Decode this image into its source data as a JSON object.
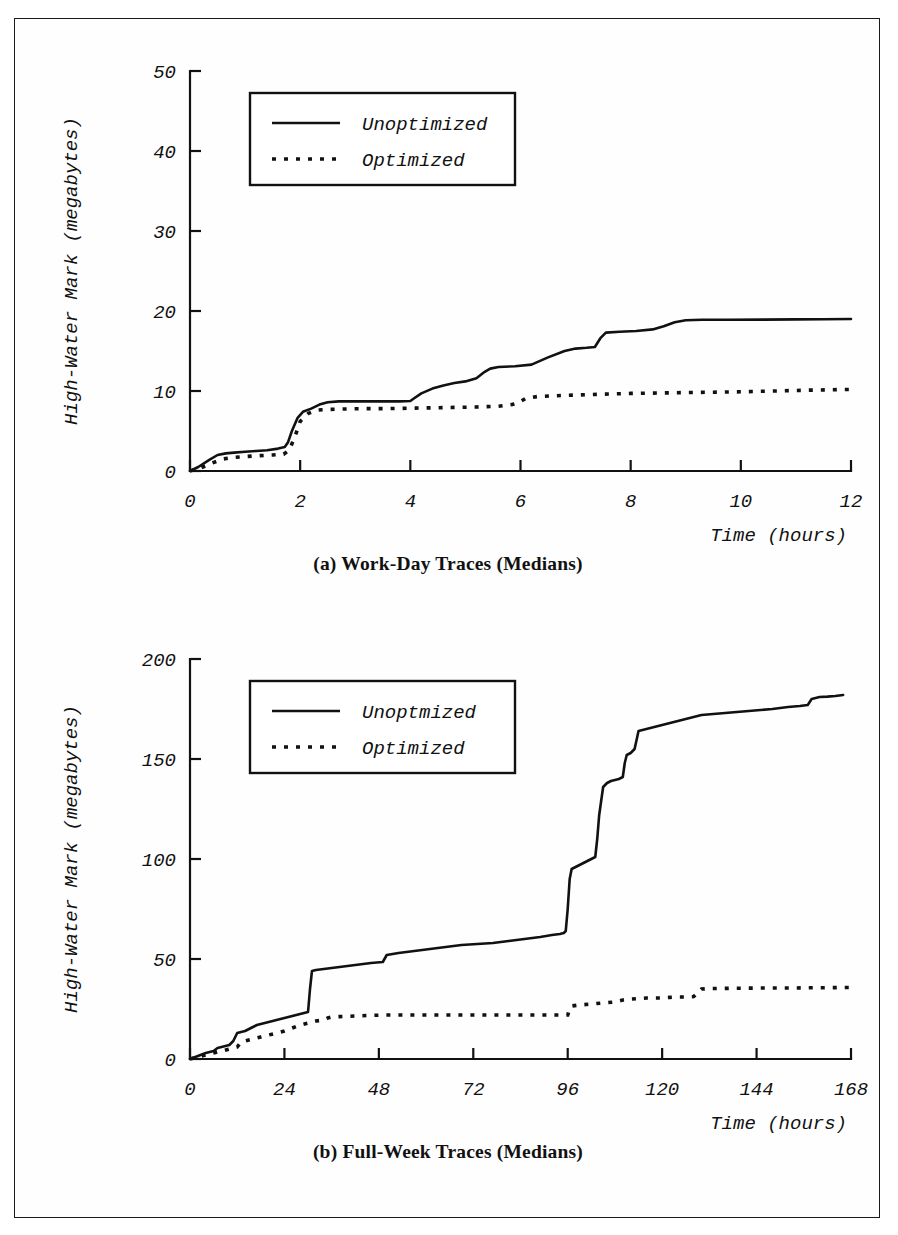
{
  "page": {
    "background_color": "#ffffff",
    "ink_color": "#111111",
    "border_color": "#1a1a1a"
  },
  "figures": [
    {
      "id": "figure-a",
      "caption": "(a) Work-Day Traces (Medians)",
      "legend": {
        "entries": [
          {
            "label": "Unoptimized",
            "style": "solid"
          },
          {
            "label": "Optimized",
            "style": "dotted"
          }
        ]
      },
      "chart_data": {
        "type": "line",
        "title": "(a) Work-Day Traces (Medians)",
        "xlabel": "Time (hours)",
        "ylabel": "High-Water Mark (megabytes)",
        "xlim": [
          0,
          12
        ],
        "ylim": [
          0,
          50
        ],
        "xticks": [
          0,
          2,
          4,
          6,
          8,
          10,
          12
        ],
        "xticklabels": [
          "0",
          "2",
          "4",
          "6",
          "8",
          "10",
          "12"
        ],
        "yticks": [
          0,
          10,
          20,
          30,
          40,
          50
        ],
        "yticklabels": [
          "0",
          "10",
          "20",
          "30",
          "40",
          "50"
        ],
        "grid": false,
        "legend_position": "upper-left",
        "series": [
          {
            "name": "Unoptimized",
            "style": "solid",
            "x": [
              0.0,
              0.15,
              0.35,
              0.5,
              0.65,
              0.8,
              1.0,
              1.2,
              1.4,
              1.6,
              1.72,
              1.78,
              1.85,
              1.95,
              2.05,
              2.2,
              2.35,
              2.5,
              2.7,
              3.0,
              3.4,
              3.8,
              4.0,
              4.05,
              4.2,
              4.4,
              4.6,
              4.8,
              5.0,
              5.2,
              5.35,
              5.45,
              5.6,
              5.9,
              6.2,
              6.5,
              6.8,
              7.0,
              7.2,
              7.35,
              7.45,
              7.55,
              7.8,
              8.1,
              8.4,
              8.6,
              8.8,
              9.0,
              9.3,
              9.8,
              10.4,
              11.0,
              11.5,
              12.0
            ],
            "y": [
              0.0,
              0.5,
              1.4,
              2.0,
              2.2,
              2.3,
              2.4,
              2.5,
              2.6,
              2.8,
              3.0,
              3.6,
              5.0,
              6.6,
              7.4,
              7.8,
              8.3,
              8.6,
              8.7,
              8.7,
              8.7,
              8.7,
              8.75,
              9.0,
              9.7,
              10.3,
              10.7,
              11.0,
              11.2,
              11.6,
              12.4,
              12.8,
              13.0,
              13.1,
              13.3,
              14.2,
              15.0,
              15.3,
              15.4,
              15.5,
              16.6,
              17.3,
              17.4,
              17.5,
              17.7,
              18.1,
              18.6,
              18.85,
              18.9,
              18.9,
              18.92,
              18.95,
              18.97,
              19.0
            ]
          },
          {
            "name": "Optimized",
            "style": "dotted",
            "x": [
              0.0,
              0.2,
              0.4,
              0.6,
              0.8,
              1.0,
              1.2,
              1.5,
              1.7,
              1.8,
              1.9,
              2.0,
              2.15,
              2.3,
              2.5,
              2.8,
              3.2,
              3.6,
              4.0,
              4.4,
              4.8,
              5.2,
              5.6,
              5.85,
              6.0,
              6.1,
              6.3,
              6.6,
              7.0,
              7.5,
              8.0,
              8.5,
              9.0,
              9.5,
              10.0,
              10.6,
              11.2,
              11.6,
              12.0
            ],
            "y": [
              0.0,
              0.4,
              1.0,
              1.5,
              1.7,
              1.8,
              1.9,
              2.0,
              2.1,
              2.6,
              4.2,
              6.2,
              7.2,
              7.6,
              7.7,
              7.75,
              7.8,
              7.8,
              7.85,
              7.9,
              7.95,
              8.0,
              8.1,
              8.3,
              8.7,
              9.1,
              9.3,
              9.4,
              9.5,
              9.6,
              9.7,
              9.75,
              9.8,
              9.85,
              9.9,
              10.0,
              10.1,
              10.15,
              10.2
            ]
          }
        ]
      }
    },
    {
      "id": "figure-b",
      "caption": "(b) Full-Week Traces (Medians)",
      "legend": {
        "entries": [
          {
            "label": "Unoptmized",
            "style": "solid"
          },
          {
            "label": "Optimized",
            "style": "dotted"
          }
        ]
      },
      "chart_data": {
        "type": "line",
        "title": "(b) Full-Week Traces (Medians)",
        "xlabel": "Time (hours)",
        "ylabel": "High-Water Mark (megabytes)",
        "xlim": [
          0,
          168
        ],
        "ylim": [
          0,
          200
        ],
        "xticks": [
          0,
          24,
          48,
          72,
          96,
          120,
          144,
          168
        ],
        "xticklabels": [
          "0",
          "24",
          "48",
          "72",
          "96",
          "120",
          "144",
          "168"
        ],
        "yticks": [
          0,
          50,
          100,
          150,
          200
        ],
        "yticklabels": [
          "0",
          "50",
          "100",
          "150",
          "200"
        ],
        "grid": false,
        "legend_position": "upper-left",
        "series": [
          {
            "name": "Unoptmized",
            "style": "solid",
            "x": [
              0,
              2,
              4,
              6,
              7,
              8,
              9,
              10,
              11,
              12,
              13,
              14,
              15,
              16,
              17,
              19,
              21,
              23,
              25,
              27,
              29,
              30,
              30.5,
              31,
              32,
              34,
              38,
              42,
              46,
              49,
              50,
              53,
              57,
              61,
              65,
              69,
              73,
              77,
              81,
              85,
              89,
              92,
              94,
              95,
              95.5,
              96,
              96.5,
              97,
              98,
              99,
              100,
              101,
              102,
              103,
              103.5,
              104,
              105,
              106,
              107,
              108,
              109,
              110,
              110.5,
              111,
              112,
              113,
              114,
              116,
              118,
              120,
              122,
              124,
              126,
              128,
              130,
              133,
              136,
              139,
              142,
              145,
              148,
              150,
              152,
              155,
              157,
              158,
              159,
              160,
              162,
              164,
              166,
              168
            ],
            "y": [
              0,
              1.5,
              3.0,
              4.0,
              5.5,
              6.0,
              6.5,
              7.0,
              9.0,
              13.0,
              13.5,
              14.0,
              15.0,
              16.0,
              17.0,
              18.0,
              19.0,
              20.0,
              21.0,
              22.0,
              23.0,
              23.5,
              35.0,
              44.0,
              44.5,
              45.0,
              46.0,
              47.0,
              48.0,
              48.5,
              52.0,
              53.0,
              54.0,
              55.0,
              56.0,
              57.0,
              57.5,
              58.0,
              59.0,
              60.0,
              61.0,
              62.0,
              62.5,
              63.0,
              64.0,
              75.0,
              90.0,
              95.0,
              96.0,
              97.0,
              98.0,
              99.0,
              100.0,
              101.0,
              110.0,
              122.0,
              136.0,
              138.0,
              139.0,
              139.5,
              140.0,
              141.0,
              148.0,
              152.0,
              153.0,
              155.0,
              164.0,
              165.0,
              166.0,
              167.0,
              168.0,
              169.0,
              170.0,
              171.0,
              172.0,
              172.5,
              173.0,
              173.5,
              174.0,
              174.5,
              175.0,
              175.5,
              176.0,
              176.5,
              177.0,
              180.0,
              180.5,
              181.0,
              181.2,
              181.5,
              182.0
            ]
          },
          {
            "name": "Optimized",
            "style": "dotted",
            "x": [
              0,
              2,
              4,
              6,
              8,
              10,
              12,
              13,
              14,
              16,
              18,
              20,
              22,
              24,
              26,
              28,
              30,
              32,
              34,
              35,
              36,
              38,
              42,
              46,
              50,
              54,
              58,
              62,
              66,
              70,
              74,
              78,
              82,
              86,
              90,
              93,
              95,
              96,
              96.5,
              97,
              99,
              102,
              105,
              108,
              110,
              112,
              114,
              116,
              118,
              120,
              122,
              124,
              126,
              128,
              129,
              130,
              132,
              136,
              140,
              146,
              152,
              158,
              164,
              168
            ],
            "y": [
              0,
              1.0,
              2.0,
              3.0,
              4.0,
              5.0,
              6.0,
              8.5,
              9.0,
              10.0,
              11.0,
              12.0,
              13.0,
              14.0,
              15.5,
              17.0,
              18.0,
              19.0,
              19.5,
              20.5,
              21.0,
              21.2,
              21.5,
              21.8,
              22.0,
              22.0,
              22.0,
              22.0,
              22.0,
              22.0,
              22.0,
              22.0,
              22.0,
              22.0,
              22.0,
              22.0,
              22.0,
              22.0,
              25.0,
              26.5,
              27.0,
              27.5,
              28.0,
              28.5,
              29.5,
              30.0,
              30.2,
              30.5,
              30.5,
              30.5,
              30.8,
              31.0,
              31.0,
              31.2,
              33.0,
              35.0,
              35.2,
              35.3,
              35.4,
              35.5,
              35.5,
              35.6,
              35.7,
              35.8
            ]
          }
        ]
      }
    }
  ]
}
